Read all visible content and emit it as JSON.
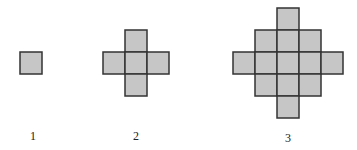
{
  "diagram": {
    "cell_size": 22,
    "fill_color": "#c6c6c6",
    "stroke_color": "#333333",
    "figures": [
      {
        "label": "1",
        "label_x": 33,
        "label_y": 129,
        "origin_x": 20,
        "origin_y": 52,
        "cells": [
          [
            0,
            0
          ]
        ]
      },
      {
        "label": "2",
        "label_x": 136,
        "label_y": 129,
        "origin_x": 103,
        "origin_y": 30,
        "cells": [
          [
            1,
            0
          ],
          [
            0,
            1
          ],
          [
            1,
            1
          ],
          [
            2,
            1
          ],
          [
            1,
            2
          ]
        ]
      },
      {
        "label": "3",
        "label_x": 288,
        "label_y": 131,
        "origin_x": 233,
        "origin_y": 8,
        "cells": [
          [
            2,
            0
          ],
          [
            1,
            1
          ],
          [
            2,
            1
          ],
          [
            3,
            1
          ],
          [
            0,
            2
          ],
          [
            1,
            2
          ],
          [
            2,
            2
          ],
          [
            3,
            2
          ],
          [
            4,
            2
          ],
          [
            1,
            3
          ],
          [
            2,
            3
          ],
          [
            3,
            3
          ],
          [
            2,
            4
          ]
        ]
      }
    ]
  }
}
